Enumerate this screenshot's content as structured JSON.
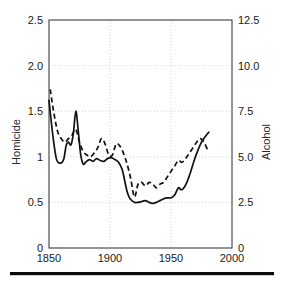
{
  "figure": {
    "background": "#ffffff",
    "ink_color": "#111111",
    "grid_color": "#c9c9c9",
    "frame_color": "#3c3c3c",
    "bottom_rule": "horizontal-rule"
  },
  "chart_data": {
    "type": "line",
    "title": "",
    "xlabel": "",
    "ylabel": "Homicide",
    "y2label": "Alcohol",
    "xlim": [
      1850,
      2000
    ],
    "ylim": [
      0,
      2.5
    ],
    "y2lim": [
      0,
      12.5
    ],
    "xticks": [
      1850,
      1900,
      1950,
      2000
    ],
    "xtick_labels": [
      "1850",
      "1900",
      "1950",
      "2000"
    ],
    "yticks": [
      0,
      0.5,
      1,
      1.5,
      2.0,
      2.5
    ],
    "ytick_labels": [
      "0",
      "0.5",
      "1",
      "1.5",
      "2.0",
      "2.5"
    ],
    "y2ticks": [
      0,
      2.5,
      5.0,
      7.5,
      10.0,
      12.5
    ],
    "y2tick_labels": [
      "0",
      "2.5",
      "5.0",
      "7.5",
      "10.0",
      "12.5"
    ],
    "grid": true,
    "grid_style": "dotted",
    "legend": "none",
    "series": [
      {
        "name": "Homicide",
        "style": "solid",
        "axis": "left",
        "x": [
          1850,
          1853,
          1856,
          1859,
          1862,
          1864,
          1866,
          1868,
          1870,
          1872,
          1874,
          1876,
          1878,
          1880,
          1883,
          1886,
          1889,
          1892,
          1895,
          1898,
          1901,
          1904,
          1907,
          1910,
          1912,
          1914,
          1916,
          1918,
          1920,
          1923,
          1926,
          1929,
          1932,
          1935,
          1938,
          1941,
          1944,
          1947,
          1950,
          1953,
          1956,
          1958,
          1960,
          1963,
          1966,
          1969,
          1972,
          1975,
          1978,
          1981
        ],
        "y": [
          1.62,
          1.25,
          0.98,
          0.93,
          0.97,
          1.12,
          1.16,
          1.13,
          1.26,
          1.5,
          1.28,
          1.02,
          0.92,
          0.94,
          0.97,
          0.95,
          0.98,
          0.96,
          0.95,
          0.98,
          0.99,
          0.97,
          0.94,
          0.86,
          0.74,
          0.62,
          0.55,
          0.52,
          0.5,
          0.5,
          0.51,
          0.52,
          0.5,
          0.49,
          0.5,
          0.52,
          0.54,
          0.55,
          0.55,
          0.58,
          0.66,
          0.64,
          0.65,
          0.72,
          0.83,
          0.96,
          1.07,
          1.16,
          1.22,
          1.27
        ]
      },
      {
        "name": "Alcohol",
        "style": "dashed",
        "axis": "right",
        "x": [
          1851,
          1854,
          1857,
          1860,
          1863,
          1866,
          1869,
          1872,
          1875,
          1878,
          1881,
          1884,
          1887,
          1890,
          1893,
          1896,
          1899,
          1902,
          1905,
          1908,
          1911,
          1914,
          1917,
          1920,
          1923,
          1926,
          1929,
          1932,
          1935,
          1938,
          1941,
          1944,
          1947,
          1950,
          1953,
          1956,
          1959,
          1962,
          1965,
          1968,
          1971,
          1974,
          1977,
          1980,
          1982
        ],
        "y": [
          8.7,
          7.4,
          6.4,
          6.0,
          5.8,
          6.0,
          6.2,
          6.5,
          5.8,
          5.3,
          5.1,
          5.0,
          5.2,
          5.5,
          6.0,
          5.7,
          5.1,
          5.1,
          5.7,
          5.6,
          5.2,
          4.6,
          3.8,
          2.8,
          3.5,
          3.6,
          3.4,
          3.6,
          3.5,
          3.3,
          3.5,
          3.6,
          3.9,
          4.2,
          4.5,
          4.8,
          4.7,
          4.9,
          5.2,
          5.5,
          5.8,
          6.0,
          5.8,
          5.4,
          5.4
        ]
      }
    ]
  }
}
